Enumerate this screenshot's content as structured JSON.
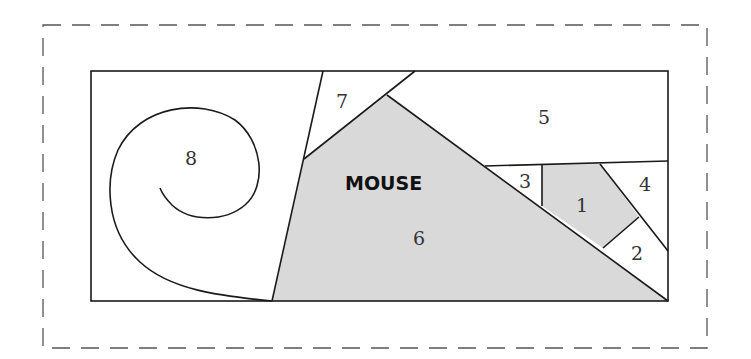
{
  "diagram": {
    "title": "MOUSE",
    "regions": [
      {
        "id": 1,
        "label": "1",
        "shaded": true
      },
      {
        "id": 2,
        "label": "2",
        "shaded": false
      },
      {
        "id": 3,
        "label": "3",
        "shaded": false
      },
      {
        "id": 4,
        "label": "4",
        "shaded": false
      },
      {
        "id": 5,
        "label": "5",
        "shaded": false
      },
      {
        "id": 6,
        "label": "6",
        "shaded": true
      },
      {
        "id": 7,
        "label": "7",
        "shaded": false
      },
      {
        "id": 8,
        "label": "8",
        "shaded": false
      }
    ],
    "colors": {
      "shade": "#d9d9d9",
      "line": "#1a1a1a",
      "dash": "#555555"
    }
  }
}
